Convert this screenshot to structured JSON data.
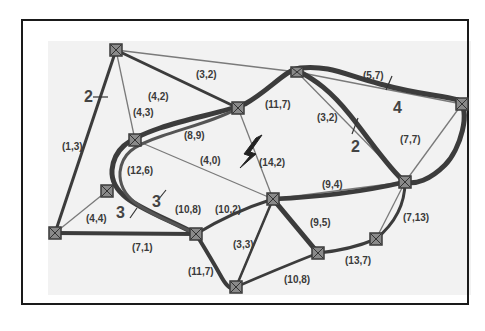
{
  "diagram": {
    "type": "network-graph",
    "colors": {
      "frame": "#1a1a1a",
      "background": "#f2f2f2",
      "thin_edge": "#7a7a7a",
      "thick_path": "#3c3c3c",
      "node_fill": "#8a8a8a",
      "node_stroke": "#3a3a3a"
    },
    "nodes": [
      {
        "id": "N1",
        "x": 116,
        "y": 50
      },
      {
        "id": "N2",
        "x": 297,
        "y": 72
      },
      {
        "id": "N3",
        "x": 462,
        "y": 104
      },
      {
        "id": "N4",
        "x": 238,
        "y": 108
      },
      {
        "id": "N5",
        "x": 135,
        "y": 140
      },
      {
        "id": "N6",
        "x": 107,
        "y": 191
      },
      {
        "id": "N7",
        "x": 405,
        "y": 182
      },
      {
        "id": "N8",
        "x": 273,
        "y": 199
      },
      {
        "id": "N9",
        "x": 55,
        "y": 233
      },
      {
        "id": "N10",
        "x": 196,
        "y": 234
      },
      {
        "id": "N11",
        "x": 376,
        "y": 239
      },
      {
        "id": "N12",
        "x": 318,
        "y": 253
      },
      {
        "id": "N13",
        "x": 236,
        "y": 287
      }
    ],
    "edge_labels": [
      {
        "text": "(3,2)",
        "x": 210,
        "y": 75
      },
      {
        "text": "(4,2)",
        "x": 158,
        "y": 97
      },
      {
        "text": "(4,3)",
        "x": 137,
        "y": 116
      },
      {
        "text": "(1,3)",
        "x": 63,
        "y": 148
      },
      {
        "text": "(8,9)",
        "x": 188,
        "y": 137
      },
      {
        "text": "(11,7)",
        "x": 267,
        "y": 107
      },
      {
        "text": "(5,7)",
        "x": 365,
        "y": 78
      },
      {
        "text": "(3,2)",
        "x": 318,
        "y": 121
      },
      {
        "text": "(7,7)",
        "x": 400,
        "y": 143
      },
      {
        "text": "(4,0)",
        "x": 203,
        "y": 163
      },
      {
        "text": "(14,2)",
        "x": 258,
        "y": 166
      },
      {
        "text": "(12,6)",
        "x": 128,
        "y": 173
      },
      {
        "text": "(9,4)",
        "x": 325,
        "y": 188
      },
      {
        "text": "(4,4)",
        "x": 87,
        "y": 221
      },
      {
        "text": "(10,8)",
        "x": 176,
        "y": 212
      },
      {
        "text": "(10,2)",
        "x": 215,
        "y": 212
      },
      {
        "text": "(7,13)",
        "x": 403,
        "y": 221
      },
      {
        "text": "(9,5)",
        "x": 293,
        "y": 226
      },
      {
        "text": "(3,3)",
        "x": 232,
        "y": 248
      },
      {
        "text": "(7,1)",
        "x": 133,
        "y": 252
      },
      {
        "text": "(13,7)",
        "x": 353,
        "y": 264
      },
      {
        "text": "(11,7)",
        "x": 190,
        "y": 275
      },
      {
        "text": "(10,8)",
        "x": 285,
        "y": 283
      }
    ],
    "capacity_labels": [
      {
        "text": "2",
        "x": 87,
        "y": 102
      },
      {
        "text": "4",
        "x": 397,
        "y": 110
      },
      {
        "text": "2",
        "x": 356,
        "y": 148
      },
      {
        "text": "3",
        "x": 152,
        "y": 207
      },
      {
        "text": "3",
        "x": 117,
        "y": 218
      }
    ],
    "failure_icon": "lightning-bolt-icon"
  }
}
